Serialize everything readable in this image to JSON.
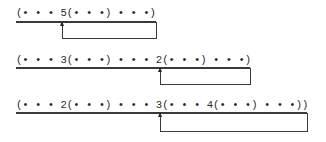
{
  "diagrams": [
    {
      "expression": "(• • • 5(• • •) • • •)",
      "underline_width": 140,
      "loop": {
        "left": 62,
        "right": 156
      }
    },
    {
      "expression": "(• • • 3(• • •) • • • 2(• • •) • • •)",
      "underline_width": 234,
      "loop": {
        "left": 160,
        "right": 250
      }
    },
    {
      "expression": "(• • • 2(• • •) • • • 3(• • • 4(• • •) • • •))",
      "underline_width": 291,
      "loop": {
        "left": 160,
        "right": 307
      }
    }
  ]
}
